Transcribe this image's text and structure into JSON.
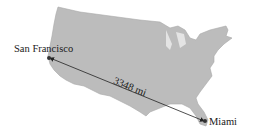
{
  "diagram": {
    "title": "",
    "map_region": "United States",
    "colors": {
      "land": "#bcbcbc",
      "land_shadow": "#9a9a9a",
      "line": "#222222",
      "point": "#333333",
      "text": "#1a1a1a"
    },
    "points": [
      {
        "name": "San Francisco",
        "x": 49,
        "y": 58
      },
      {
        "name": "Miami",
        "x": 205,
        "y": 121
      }
    ],
    "route": {
      "from": "San Francisco",
      "to": "Miami",
      "distance_label": "3348 mi"
    }
  }
}
